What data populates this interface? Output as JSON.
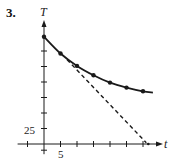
{
  "problem": {
    "number": "3."
  },
  "chart_data": {
    "type": "line",
    "title": "",
    "xlabel": "t",
    "ylabel": "T",
    "x_tick_label": {
      "value": 5,
      "text": "5"
    },
    "y_tick_label": {
      "value": 25,
      "text": "25"
    },
    "x_ticks": [
      -5,
      5,
      10,
      15,
      20,
      25,
      30
    ],
    "y_ticks": [
      25,
      50,
      75,
      100,
      125,
      150
    ],
    "y_neg_tick": -10,
    "xlim": [
      -8,
      37
    ],
    "ylim": [
      -15,
      205
    ],
    "series": [
      {
        "name": "T(t) data (solid curve with points)",
        "style": "solid",
        "x": [
          0,
          5,
          10,
          15,
          20,
          25,
          30
        ],
        "values": [
          173,
          146,
          126,
          111,
          99,
          91,
          85
        ],
        "curve_end": {
          "x": 33,
          "y": 83
        }
      },
      {
        "name": "tangent line at t=5 (dashed)",
        "style": "dashed",
        "x": [
          7,
          31
        ],
        "values": [
          136,
          2
        ]
      }
    ],
    "grid": false,
    "legend": null
  },
  "colors": {
    "ink": "#1a1a1a",
    "background": "#ffffff"
  }
}
